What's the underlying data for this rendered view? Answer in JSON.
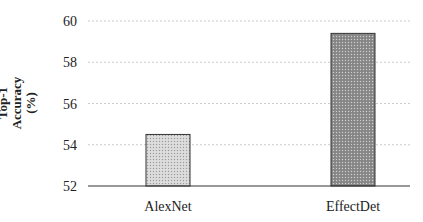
{
  "chart_data": {
    "type": "bar",
    "title": "",
    "xlabel": "",
    "ylabel": "Top-1 Accuracy (%)",
    "ylabel_lines": [
      "Top-1",
      "Accuracy",
      "(%)"
    ],
    "categories": [
      "AlexNet",
      "EffectDet"
    ],
    "values": [
      54.5,
      59.4
    ],
    "ylim": [
      52,
      60
    ],
    "yticks": [
      52,
      54,
      56,
      58,
      60
    ],
    "grid": true,
    "grid_style": "dashed horizontal",
    "legend": null,
    "bar_colors": [
      "#cfcfcf",
      "#8f8f8f"
    ],
    "bar_edge_color": "#333333"
  }
}
